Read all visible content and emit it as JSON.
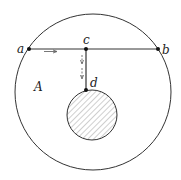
{
  "diagram": {
    "labels": {
      "a": "a",
      "b": "b",
      "c": "c",
      "d": "d",
      "region": "A"
    },
    "colors": {
      "stroke": "#333333",
      "hatch": "#888888",
      "background": "#ffffff"
    }
  }
}
